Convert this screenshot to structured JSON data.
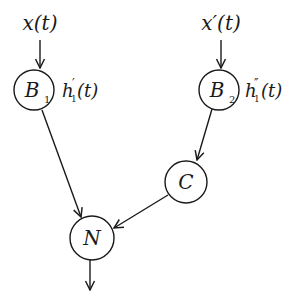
{
  "diagram": {
    "inputs": [
      {
        "id": "x",
        "label": "x(t)"
      },
      {
        "id": "xprime",
        "label": "x′(t)"
      }
    ],
    "nodes": [
      {
        "id": "B1",
        "label": "B",
        "subscript": "1",
        "cx": 34,
        "cy": 90,
        "r": 20
      },
      {
        "id": "B2",
        "label": "B",
        "subscript": "2",
        "cx": 219,
        "cy": 90,
        "r": 20
      },
      {
        "id": "C",
        "label": "C",
        "cx": 186,
        "cy": 182,
        "r": 21
      },
      {
        "id": "N",
        "label": "N",
        "cx": 92,
        "cy": 238,
        "r": 22
      }
    ],
    "side_labels": [
      {
        "node": "B1",
        "text": "h",
        "sub": "1",
        "mark": "′",
        "suffix": "(t)"
      },
      {
        "node": "B2",
        "text": "h",
        "sub": "1",
        "mark": "″",
        "suffix": "(t)"
      }
    ],
    "edges": [
      {
        "from": "x(t)",
        "to": "B1"
      },
      {
        "from": "x′(t)",
        "to": "B2"
      },
      {
        "from": "B1",
        "to": "N"
      },
      {
        "from": "B2",
        "to": "C"
      },
      {
        "from": "C",
        "to": "N"
      },
      {
        "from": "N",
        "to": "output"
      }
    ]
  }
}
